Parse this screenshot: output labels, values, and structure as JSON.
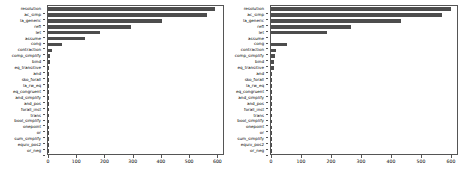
{
  "figure": {
    "background": "#ffffff",
    "bar_color": "#4d4d4d",
    "axis_color": "#555555",
    "panel_count": 2
  },
  "chart_data": [
    {
      "type": "bar",
      "orientation": "horizontal",
      "title": "",
      "xlabel": "",
      "ylabel": "",
      "xlim": [
        0,
        620
      ],
      "xticks": [
        0,
        100,
        200,
        300,
        400,
        500,
        600
      ],
      "grid": false,
      "legend": null,
      "categories": [
        "resolution",
        "ac_simp",
        "la_generic",
        "refl",
        "let",
        "assume",
        "cong",
        "contraction",
        "comp_simplify",
        "bind",
        "eq_transitive",
        "and",
        "sko_forall",
        "la_rw_eq",
        "eq_congruent",
        "and_simplify",
        "and_pos",
        "forall_inst",
        "trans",
        "bool_simplify",
        "onepoint",
        "or",
        "sum_simplify",
        "equiv_pos2",
        "or_neg"
      ],
      "values": [
        590,
        565,
        403,
        295,
        185,
        130,
        48,
        15,
        8,
        7,
        5,
        2,
        1,
        1,
        1,
        1,
        1,
        1,
        1,
        1,
        1,
        1,
        1,
        1,
        1
      ]
    },
    {
      "type": "bar",
      "orientation": "horizontal",
      "title": "",
      "xlabel": "",
      "ylabel": "",
      "xlim": [
        0,
        620
      ],
      "xticks": [
        0,
        100,
        200,
        300,
        400,
        500,
        600
      ],
      "grid": false,
      "legend": null,
      "categories": [
        "resolution",
        "ac_simp",
        "la_generic",
        "refl",
        "let",
        "assume",
        "cong",
        "contraction",
        "comp_simplify",
        "bind",
        "eq_transitive",
        "and",
        "sko_forall",
        "la_rw_eq",
        "eq_congruent",
        "and_simplify",
        "and_pos",
        "forall_inst",
        "trans",
        "bool_simplify",
        "onepoint",
        "or",
        "sum_simplify",
        "equiv_pos2",
        "or_neg"
      ],
      "values": [
        600,
        570,
        432,
        265,
        185,
        0,
        53,
        15,
        13,
        10,
        10,
        2,
        1,
        1,
        1,
        1,
        1,
        1,
        1,
        1,
        1,
        1,
        1,
        1,
        1
      ]
    }
  ]
}
